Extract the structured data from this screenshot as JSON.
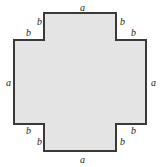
{
  "figure": {
    "name": "cross-polygon",
    "fill_color": "#e4e4e4",
    "stroke_color": "#3a3a3a",
    "background_color": "#ffffff",
    "stroke_width": 2,
    "vertices": [
      [
        44,
        13
      ],
      [
        116,
        13
      ],
      [
        116,
        40
      ],
      [
        146,
        40
      ],
      [
        146,
        124
      ],
      [
        116,
        124
      ],
      [
        116,
        151
      ],
      [
        44,
        151
      ],
      [
        44,
        124
      ],
      [
        14,
        124
      ],
      [
        14,
        40
      ],
      [
        44,
        40
      ]
    ]
  },
  "labels": {
    "side_a": "a",
    "side_b": "b",
    "a_labels": [
      {
        "text": "a",
        "x": 80,
        "y": 3,
        "name": "label-a-top"
      },
      {
        "text": "a",
        "x": 151,
        "y": 78,
        "name": "label-a-right"
      },
      {
        "text": "a",
        "x": 80,
        "y": 155,
        "name": "label-a-bottom"
      },
      {
        "text": "a",
        "x": 6,
        "y": 78,
        "name": "label-a-left"
      }
    ],
    "b_labels": [
      {
        "text": "b",
        "x": 37,
        "y": 17,
        "name": "label-b-top-left-upper"
      },
      {
        "text": "b",
        "x": 26,
        "y": 28,
        "name": "label-b-top-left-lower"
      },
      {
        "text": "b",
        "x": 120,
        "y": 17,
        "name": "label-b-top-right-upper"
      },
      {
        "text": "b",
        "x": 131,
        "y": 28,
        "name": "label-b-top-right-lower"
      },
      {
        "text": "b",
        "x": 26,
        "y": 126,
        "name": "label-b-bottom-left-upper"
      },
      {
        "text": "b",
        "x": 37,
        "y": 137,
        "name": "label-b-bottom-left-lower"
      },
      {
        "text": "b",
        "x": 131,
        "y": 126,
        "name": "label-b-bottom-right-upper"
      },
      {
        "text": "b",
        "x": 120,
        "y": 137,
        "name": "label-b-bottom-right-lower"
      }
    ]
  }
}
